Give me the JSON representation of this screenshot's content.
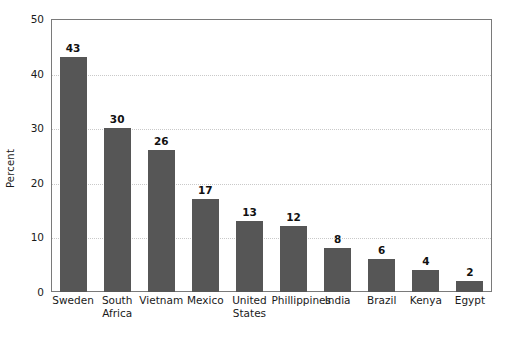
{
  "chart_data": {
    "type": "bar",
    "title": "",
    "subtitle": "",
    "xlabel": "",
    "ylabel": "Percent",
    "categories": [
      "Sweden",
      "South\nAfrica",
      "Vietnam",
      "Mexico",
      "United\nStates",
      "Phillippines",
      "India",
      "Brazil",
      "Kenya",
      "Egypt"
    ],
    "values": [
      43,
      30,
      26,
      17,
      13,
      12,
      8,
      6,
      4,
      2
    ],
    "data_labels": [
      "43",
      "30",
      "26",
      "17",
      "13",
      "12",
      "8",
      "6",
      "4",
      "2"
    ],
    "ylim": [
      0,
      50
    ],
    "yticks": [
      0,
      10,
      20,
      30,
      40,
      50
    ],
    "ytick_labels": [
      "0",
      "10",
      "20",
      "30",
      "40",
      "50"
    ],
    "gridlines": {
      "horizontal": true,
      "vertical": false,
      "style": "dotted",
      "at": [
        10,
        20,
        30,
        40
      ]
    },
    "legend": {
      "visible": false,
      "position": "none",
      "entries": []
    },
    "colors": {
      "bar": "#565656",
      "frame": "#7a7a7a",
      "gridline": "#c9c9c9",
      "text": "#1a1a1a",
      "background": "#ffffff"
    }
  }
}
